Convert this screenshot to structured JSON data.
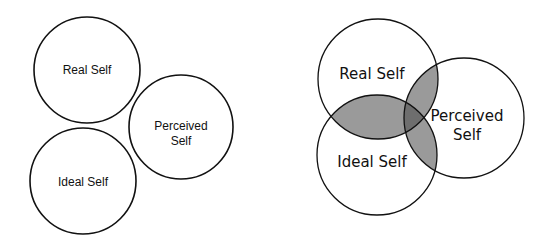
{
  "diagrams": [
    {
      "name": "separate-selves",
      "circles": [
        {
          "id": "real",
          "label": "Real Self",
          "cx": 87,
          "cy": 70,
          "r": 53
        },
        {
          "id": "perceived",
          "label_line1": "Perceived",
          "label_line2": "Self",
          "cx": 181,
          "cy": 127,
          "r": 52
        },
        {
          "id": "ideal",
          "label": "Ideal Self",
          "cx": 83,
          "cy": 181,
          "r": 53
        }
      ]
    },
    {
      "name": "overlapping-selves",
      "circles": [
        {
          "id": "real",
          "label": "Real Self",
          "cx": 378,
          "cy": 79,
          "r": 60
        },
        {
          "id": "perceived",
          "label_line1": "Perceived",
          "label_line2": "Self",
          "cx": 464,
          "cy": 118,
          "r": 60
        },
        {
          "id": "ideal",
          "label": "Ideal Self",
          "cx": 377,
          "cy": 155,
          "r": 60
        }
      ],
      "overlap_color": "#9a9a9a",
      "center_overlap_color": "#6e6e6e"
    }
  ],
  "colors": {
    "stroke": "#111111",
    "background": "#ffffff"
  }
}
